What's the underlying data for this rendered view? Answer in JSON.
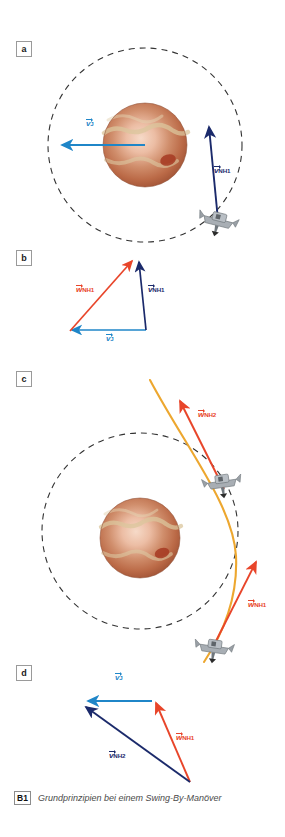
{
  "figure": {
    "caption_badge": "B1",
    "caption_text": "Grundprinzipien bei einem Swing-By-Manöver",
    "panels": [
      {
        "id": "a",
        "label": "a"
      },
      {
        "id": "b",
        "label": "b"
      },
      {
        "id": "c",
        "label": "c"
      },
      {
        "id": "d",
        "label": "d"
      }
    ]
  },
  "colors": {
    "jupiter_velocity_blue": "#1f86c8",
    "spacecraft_velocity_navy": "#1b2a6b",
    "relative_velocity_red": "#e8452a",
    "trajectory_orange": "#eda72f",
    "orbit_dash": "#333333",
    "planet_body": "#b9603f",
    "planet_band": "#d8c39a",
    "planet_core": "#f0cdb8",
    "planet_spot": "#a63a22",
    "spacecraft_body": "#9aa0a6"
  },
  "panel_a": {
    "label": "a",
    "description": "Jupiter with orbit circle, spacecraft approaching",
    "vectors": [
      {
        "name": "v-jupiter",
        "base": "v",
        "sub": "J",
        "color": "#1f86c8",
        "label_x": 86,
        "label_y": 120
      },
      {
        "name": "v-nh1",
        "base": "v",
        "sub": "NH1",
        "color": "#1b2a6b",
        "label_x": 214,
        "label_y": 168
      }
    ]
  },
  "panel_b": {
    "label": "b",
    "description": "Velocity triangle before flyby",
    "vectors": [
      {
        "name": "w-nh1",
        "base": "w",
        "sub": "NH1",
        "color": "#e8452a",
        "label_x": 79,
        "label_y": 287
      },
      {
        "name": "v-nh1",
        "base": "v",
        "sub": "NH1",
        "color": "#1b2a6b",
        "label_x": 149,
        "label_y": 287
      },
      {
        "name": "v-jupiter",
        "base": "v",
        "sub": "J",
        "color": "#1f86c8",
        "label_x": 115,
        "label_y": 338
      }
    ]
  },
  "panel_c": {
    "label": "c",
    "description": "Hyperbolic flyby trajectory past Jupiter with two spacecraft positions",
    "vectors": [
      {
        "name": "w-nh2",
        "base": "w",
        "sub": "NH2",
        "color": "#e8452a",
        "label_x": 200,
        "label_y": 412
      },
      {
        "name": "w-nh1",
        "base": "w",
        "sub": "NH1",
        "color": "#e8452a",
        "label_x": 250,
        "label_y": 603
      }
    ]
  },
  "panel_d": {
    "label": "d",
    "description": "Velocity triangle after flyby",
    "vectors": [
      {
        "name": "v-jupiter",
        "base": "v",
        "sub": "J",
        "color": "#1f86c8",
        "label_x": 117,
        "label_y": 674
      },
      {
        "name": "w-nh1",
        "base": "w",
        "sub": "NH1",
        "color": "#e8452a",
        "label_x": 177,
        "label_y": 735
      },
      {
        "name": "v-nh2",
        "base": "v",
        "sub": "NH2",
        "color": "#1b2a6b",
        "label_x": 111,
        "label_y": 753
      }
    ]
  }
}
